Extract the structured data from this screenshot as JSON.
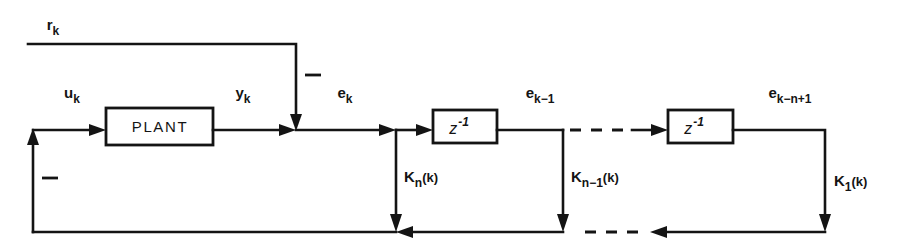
{
  "figure": {
    "kind": "control-system-block-diagram",
    "background_color": "#ffffff",
    "line_color": "#141414"
  },
  "blocks": [
    {
      "id": "plant",
      "label": "PLANT",
      "x": 106,
      "y": 108,
      "width": 107,
      "height": 37
    },
    {
      "id": "delay-1",
      "label": "z",
      "exponent": "-1",
      "x": 433,
      "y": 110,
      "width": 64,
      "height": 33
    },
    {
      "id": "delay-2",
      "label": "z",
      "exponent": "-1",
      "x": 668,
      "y": 110,
      "width": 65,
      "height": 33
    }
  ],
  "signals": [
    {
      "id": "reference",
      "base": "r",
      "subscript": "k",
      "x": 53,
      "y": 30
    },
    {
      "id": "control-input",
      "base": "u",
      "subscript": "k",
      "x": 72,
      "y": 98
    },
    {
      "id": "plant-output",
      "base": "y",
      "subscript": "k",
      "x": 243,
      "y": 98
    },
    {
      "id": "error",
      "base": "e",
      "subscript": "k",
      "x": 345,
      "y": 98
    },
    {
      "id": "error-delayed-1",
      "base": "e",
      "subscript": "k−1",
      "x": 540,
      "y": 98
    },
    {
      "id": "error-delayed-n",
      "base": "e",
      "subscript": "k−n+1",
      "x": 790,
      "y": 98
    }
  ],
  "gains": [
    {
      "id": "gain-n",
      "base": "K",
      "subscript": "n",
      "argument": "(k)",
      "tap_x": 396,
      "label_x": 404,
      "label_y": 182
    },
    {
      "id": "gain-n-minus-1",
      "base": "K",
      "subscript": "n−1",
      "argument": "(k)",
      "tap_x": 563,
      "label_x": 571,
      "label_y": 182
    },
    {
      "id": "gain-1",
      "base": "K",
      "subscript": "1",
      "argument": "(k)",
      "tap_x": 825,
      "label_x": 834,
      "label_y": 186
    }
  ],
  "summing_junctions": [
    {
      "id": "error-junction",
      "x": 296,
      "y": 130,
      "sign": "−",
      "sign_x": 305,
      "sign_y": 75
    },
    {
      "id": "input-junction",
      "x": 33,
      "y": 130,
      "sign": "−",
      "sign_x": 42,
      "sign_y": 178
    }
  ],
  "rails": {
    "reference_line_y": 44,
    "forward_line_y": 130,
    "feedback_rail_y": 232,
    "left_edge_x": 33,
    "reference_start_x": 28
  },
  "notes": {
    "dashed_forward_gap": "ellipsis between delay stages on forward path",
    "dashed_feedback_gap": "ellipsis between gain taps on feedback rail"
  }
}
